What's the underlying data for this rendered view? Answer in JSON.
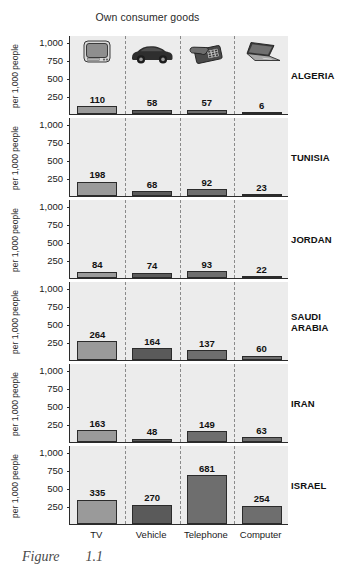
{
  "chart_title": "Own consumer goods",
  "caption": "Figure",
  "caption_number": "1.1",
  "axis": {
    "ylabel": "per 1,000 people",
    "yticks": [
      "1,000",
      "750",
      "500",
      "250"
    ],
    "ytick_values": [
      1000,
      750,
      500,
      250
    ],
    "ymax": 1100
  },
  "icons": [
    {
      "name": "television-icon",
      "label": "TV"
    },
    {
      "name": "car-icon",
      "label": "Vehicle"
    },
    {
      "name": "telephone-icon",
      "label": "Telephone"
    },
    {
      "name": "laptop-icon",
      "label": "Computer"
    }
  ],
  "colors": {
    "panel_background": "#ececec",
    "bar_tv": "#9a9a9a",
    "bar_vehicle": "#5a5a5a",
    "bar_telephone": "#6e6e6e",
    "bar_computer": "#6e6e6e",
    "axis_line": "#2b2b2b",
    "separator": "#8a8a8a"
  },
  "chart_data": {
    "type": "bar",
    "title": "Own consumer goods",
    "xlabel": "",
    "ylabel": "per 1,000 people",
    "ylim": [
      0,
      1100
    ],
    "grid": false,
    "legend": "none",
    "layout": "small-multiples, one panel per country, shared x categories",
    "categories": [
      "TV",
      "Vehicle",
      "Telephone",
      "Computer"
    ],
    "series": [
      {
        "name": "ALGERIA",
        "values": [
          110,
          58,
          57,
          6
        ]
      },
      {
        "name": "TUNISIA",
        "values": [
          198,
          68,
          92,
          23
        ]
      },
      {
        "name": "JORDAN",
        "values": [
          84,
          74,
          93,
          22
        ]
      },
      {
        "name": "SAUDI ARABIA",
        "values": [
          264,
          164,
          137,
          60
        ]
      },
      {
        "name": "IRAN",
        "values": [
          163,
          48,
          149,
          63
        ]
      },
      {
        "name": "ISRAEL",
        "values": [
          335,
          270,
          681,
          254
        ]
      }
    ]
  },
  "panels": [
    {
      "country": "ALGERIA",
      "country_display": "ALGERIA",
      "values": [
        110,
        58,
        57,
        6
      ],
      "value_labels": [
        "110",
        "58",
        "57",
        "6"
      ],
      "show_icons": true
    },
    {
      "country": "TUNISIA",
      "country_display": "TUNISIA",
      "values": [
        198,
        68,
        92,
        23
      ],
      "value_labels": [
        "198",
        "68",
        "92",
        "23"
      ],
      "show_icons": false
    },
    {
      "country": "JORDAN",
      "country_display": "JORDAN",
      "values": [
        84,
        74,
        93,
        22
      ],
      "value_labels": [
        "84",
        "74",
        "93",
        "22"
      ],
      "show_icons": false
    },
    {
      "country": "SAUDI ARABIA",
      "country_display": "SAUDI\nARABIA",
      "values": [
        264,
        164,
        137,
        60
      ],
      "value_labels": [
        "264",
        "164",
        "137",
        "60"
      ],
      "show_icons": false
    },
    {
      "country": "IRAN",
      "country_display": "IRAN",
      "values": [
        163,
        48,
        149,
        63
      ],
      "value_labels": [
        "163",
        "48",
        "149",
        "63"
      ],
      "show_icons": false
    },
    {
      "country": "ISRAEL",
      "country_display": "ISRAEL",
      "values": [
        335,
        270,
        681,
        254
      ],
      "value_labels": [
        "335",
        "270",
        "681",
        "254"
      ],
      "show_icons": false
    }
  ]
}
